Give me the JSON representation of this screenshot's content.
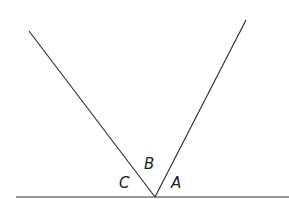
{
  "diagram": {
    "labels": {
      "a": "A",
      "b": "B",
      "c": "C"
    },
    "line_color": "#333333"
  }
}
